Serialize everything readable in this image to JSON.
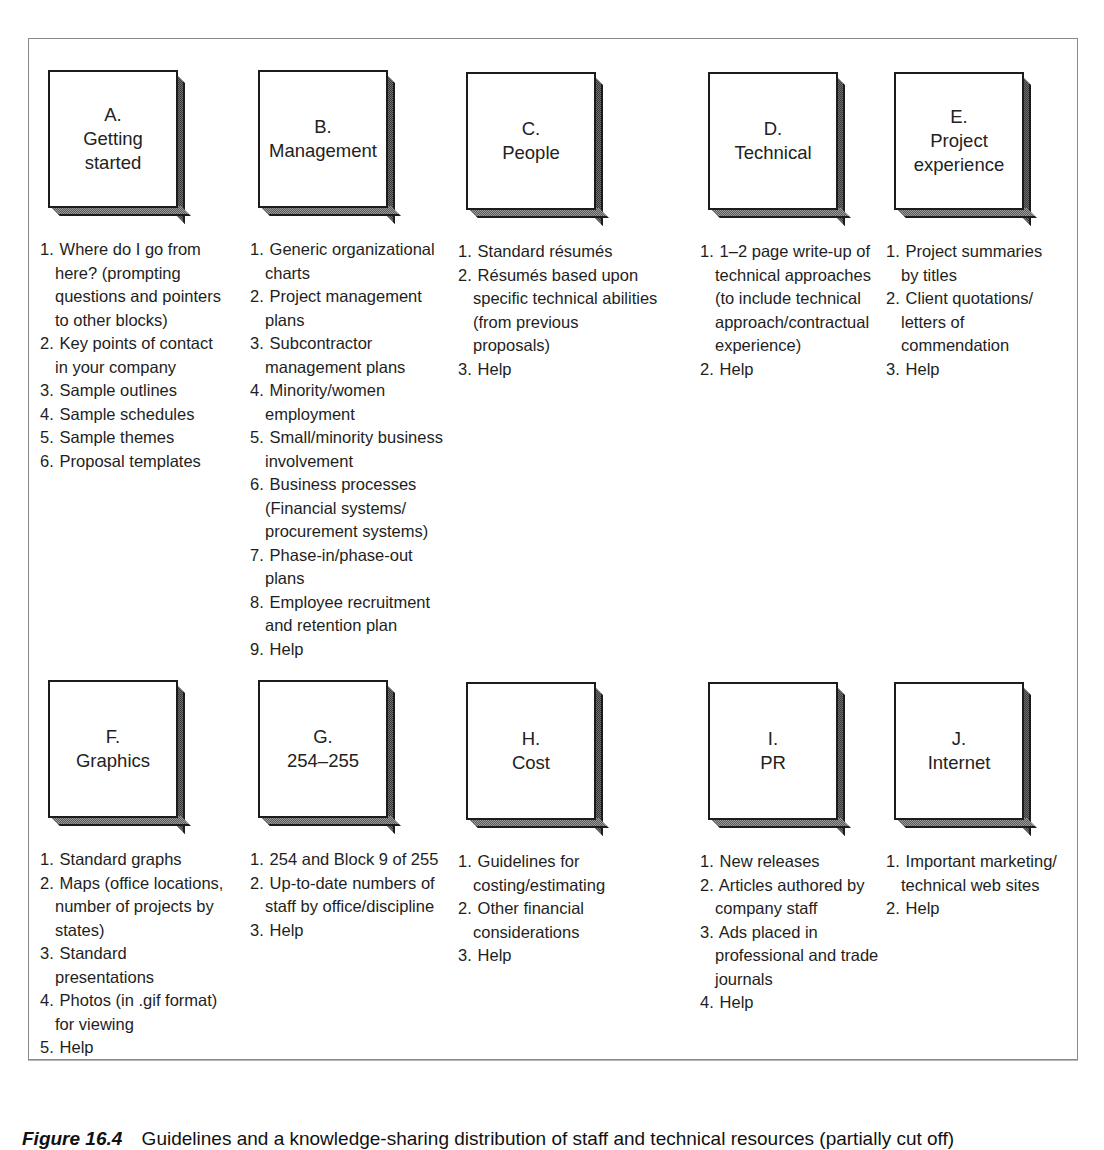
{
  "rows": [
    {
      "blocks": [
        {
          "letter": "A.",
          "title_lines": [
            "Getting",
            "started"
          ],
          "items": [
            {
              "num": "1.",
              "text": "Where do I go from here? (prompting questions and pointers to other blocks)"
            },
            {
              "num": "2.",
              "text": "Key points of contact in your company"
            },
            {
              "num": "3.",
              "text": "Sample outlines"
            },
            {
              "num": "4.",
              "text": "Sample schedules"
            },
            {
              "num": "5.",
              "text": "Sample themes"
            },
            {
              "num": "6.",
              "text": "Proposal templates"
            }
          ]
        },
        {
          "letter": "B.",
          "title_lines": [
            "Management"
          ],
          "items": [
            {
              "num": "1.",
              "text": "Generic organizational charts"
            },
            {
              "num": "2.",
              "text": "Project management plans"
            },
            {
              "num": "3.",
              "text": "Subcontractor management plans"
            },
            {
              "num": "4.",
              "text": "Minority/women employment"
            },
            {
              "num": "5.",
              "text": "Small/minority business involvement"
            },
            {
              "num": "6.",
              "text": "Business processes (Financial systems/ procurement systems)"
            },
            {
              "num": "7.",
              "text": "Phase-in/phase-out plans"
            },
            {
              "num": "8.",
              "text": "Employee recruitment and retention plan"
            },
            {
              "num": "9.",
              "text": "Help"
            }
          ]
        },
        {
          "letter": "C.",
          "title_lines": [
            "People"
          ],
          "items": [
            {
              "num": "1.",
              "text": "Standard résumés"
            },
            {
              "num": "2.",
              "text": "Résumés based upon specific technical abilities (from previous proposals)"
            },
            {
              "num": "3.",
              "text": "Help"
            }
          ]
        },
        {
          "letter": "D.",
          "title_lines": [
            "Technical"
          ],
          "items": [
            {
              "num": "1.",
              "text": "1–2 page write-up of technical approaches (to include technical approach/contractual experience)"
            },
            {
              "num": "2.",
              "text": "Help"
            }
          ]
        },
        {
          "letter": "E.",
          "title_lines": [
            "Project",
            "experience"
          ],
          "items": [
            {
              "num": "1.",
              "text": "Project summaries by titles"
            },
            {
              "num": "2.",
              "text": "Client quotations/ letters of commendation"
            },
            {
              "num": "3.",
              "text": "Help"
            }
          ]
        }
      ]
    },
    {
      "blocks": [
        {
          "letter": "F.",
          "title_lines": [
            "Graphics"
          ],
          "items": [
            {
              "num": "1.",
              "text": "Standard graphs"
            },
            {
              "num": "2.",
              "text": "Maps (office locations, number of projects by states)"
            },
            {
              "num": "3.",
              "text": "Standard presentations"
            },
            {
              "num": "4.",
              "text": "Photos (in .gif format) for viewing"
            },
            {
              "num": "5.",
              "text": "Help"
            }
          ]
        },
        {
          "letter": "G.",
          "title_lines": [
            "254–255"
          ],
          "items": [
            {
              "num": "1.",
              "text": "254 and Block 9 of 255"
            },
            {
              "num": "2.",
              "text": "Up-to-date numbers of staff by office/discipline"
            },
            {
              "num": "3.",
              "text": "Help"
            }
          ]
        },
        {
          "letter": "H.",
          "title_lines": [
            "Cost"
          ],
          "items": [
            {
              "num": "1.",
              "text": "Guidelines for costing/estimating"
            },
            {
              "num": "2.",
              "text": "Other financial considerations"
            },
            {
              "num": "3.",
              "text": "Help"
            }
          ]
        },
        {
          "letter": "I.",
          "title_lines": [
            "PR"
          ],
          "items": [
            {
              "num": "1.",
              "text": "New releases"
            },
            {
              "num": "2.",
              "text": "Articles authored by company staff"
            },
            {
              "num": "3.",
              "text": "Ads placed in professional and trade journals"
            },
            {
              "num": "4.",
              "text": "Help"
            }
          ]
        },
        {
          "letter": "J.",
          "title_lines": [
            "Internet"
          ],
          "items": [
            {
              "num": "1.",
              "text": "Important marketing/ technical web sites"
            },
            {
              "num": "2.",
              "text": "Help"
            }
          ]
        }
      ]
    }
  ],
  "caption": {
    "figure_label": "Figure 16.4",
    "text": "Guidelines and a knowledge-sharing distribution of staff and technical resources (partially cut off)"
  }
}
